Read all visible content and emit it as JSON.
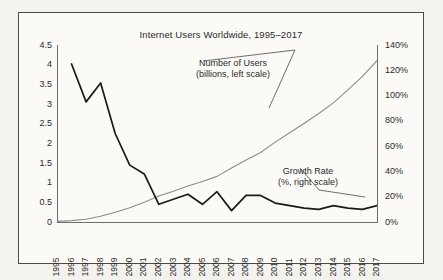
{
  "chart_data": {
    "type": "line",
    "title": "Internet Users Worldwide, 1995–2017",
    "xlabel": "",
    "ylabel": "",
    "grid": false,
    "legend_position": "inline-annotations",
    "x": [
      1995,
      1996,
      1997,
      1998,
      1999,
      2000,
      2001,
      2002,
      2003,
      2004,
      2005,
      2006,
      2007,
      2008,
      2009,
      2010,
      2011,
      2012,
      2013,
      2014,
      2015,
      2016,
      2017
    ],
    "categories": [
      "1995",
      "1996",
      "1997",
      "1998",
      "1999",
      "2000",
      "2001",
      "2002",
      "2003",
      "2004",
      "2005",
      "2006",
      "2007",
      "2008",
      "2009",
      "2010",
      "2011",
      "2012",
      "2013",
      "2014",
      "2015",
      "2016",
      "2017"
    ],
    "axes": {
      "left": {
        "label": "Number of Users (billions)",
        "ticks": [
          "0",
          "0.5",
          "1",
          "1.5",
          "2",
          "2.5",
          "3",
          "3.5",
          "4",
          "4.5"
        ],
        "tick_values": [
          0,
          0.5,
          1,
          1.5,
          2,
          2.5,
          3,
          3.5,
          4,
          4.5
        ],
        "ylim": [
          0,
          4.5
        ]
      },
      "right": {
        "label": "Growth Rate (%)",
        "ticks": [
          "0%",
          "20%",
          "40%",
          "60%",
          "80%",
          "100%",
          "120%",
          "140%"
        ],
        "tick_values": [
          0,
          20,
          40,
          60,
          80,
          100,
          120,
          140
        ],
        "ylim": [
          0,
          140
        ]
      }
    },
    "series": [
      {
        "name": "Number of Users",
        "axis": "left",
        "units": "billions",
        "color": "#8c8c8c",
        "values": [
          0.016,
          0.036,
          0.07,
          0.147,
          0.248,
          0.361,
          0.5,
          0.663,
          0.781,
          0.913,
          1.03,
          1.16,
          1.373,
          1.575,
          1.766,
          2.03,
          2.27,
          2.51,
          2.76,
          3.03,
          3.36,
          3.7,
          4.1
        ]
      },
      {
        "name": "Growth Rate",
        "axis": "right",
        "units": "%",
        "color": "#1a1a1a",
        "values": [
          null,
          125.0,
          95.0,
          110.0,
          70.0,
          45.0,
          38.0,
          14.0,
          18.0,
          22.0,
          14.0,
          24.0,
          9.0,
          21.0,
          21.0,
          15.0,
          13.0,
          11.0,
          10.0,
          13.0,
          11.0,
          10.0,
          13.0
        ]
      }
    ],
    "annotations": [
      {
        "name": "users-annotation",
        "line1": "Number of Users",
        "line2": "(billions, left scale)"
      },
      {
        "name": "growth-annotation",
        "line1": "Growth Rate",
        "line2": "(%, right scale)"
      }
    ]
  }
}
